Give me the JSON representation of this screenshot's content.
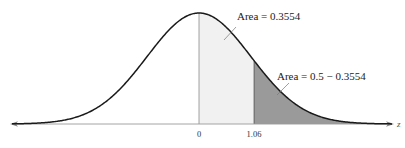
{
  "chart_data": {
    "type": "area",
    "title": "",
    "xlabel": "z",
    "ylabel": "",
    "xlim": [
      -3.6,
      3.7
    ],
    "tick_labels": [
      "0",
      "1.06"
    ],
    "tick_values": [
      0,
      1.06
    ],
    "shaded_regions": [
      {
        "from": 0,
        "to": 1.06,
        "color": "#f1f1f1",
        "label": "Area = 0.3554",
        "area": 0.3554
      },
      {
        "from": 1.06,
        "to": "inf",
        "color": "#9a9a9a",
        "label": "Area = 0.5 − 0.3554",
        "area": 0.1446
      }
    ],
    "curve": "standard normal density",
    "grid": false,
    "legend": "none"
  },
  "labels": {
    "area_center": "Area = 0.3554",
    "area_tail": "Area = 0.5 − 0.3554",
    "tick_zero": "0",
    "tick_z": "1.06",
    "axis_var": "z"
  }
}
